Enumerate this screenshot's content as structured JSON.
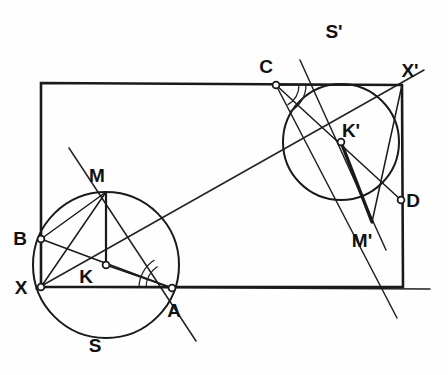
{
  "figure": {
    "type": "euclidean-construction",
    "canvas": {
      "width": 448,
      "height": 375,
      "background": "#fefefe"
    },
    "colors": {
      "stroke": "#1a1a1a",
      "thin_stroke": "#222222",
      "fill": "#ffffff",
      "label": "#111111"
    },
    "stroke_widths": {
      "rectangle": 2.6,
      "circle": 2.0,
      "chord": 1.5,
      "ray": 1.5,
      "bold_segment": 3.2,
      "arc_mark": 1.3
    },
    "rectangle": {
      "name": "bounding-rectangle",
      "corners": [
        {
          "label": "top-left",
          "x": 41,
          "y": 83
        },
        {
          "label": "X'",
          "x": 402,
          "y": 85
        },
        {
          "label": "bottom-right",
          "x": 403,
          "y": 287
        },
        {
          "label": "X",
          "x": 41,
          "y": 287
        }
      ]
    },
    "circles": [
      {
        "name": "circle-S",
        "label": "S",
        "center_label": "K",
        "cx": 106,
        "cy": 265,
        "r": 73
      },
      {
        "name": "circle-S-prime",
        "label": "S'",
        "center_label": "K'",
        "cx": 341,
        "cy": 142,
        "r": 58
      }
    ],
    "points": [
      {
        "id": "X",
        "label": "X",
        "x": 41,
        "y": 287,
        "marker": "open",
        "label_dx": -20,
        "label_dy": 7
      },
      {
        "id": "B",
        "label": "B",
        "x": 41,
        "y": 239,
        "marker": "open",
        "label_dx": -21,
        "label_dy": 6
      },
      {
        "id": "M",
        "label": "M",
        "x": 106,
        "y": 192,
        "marker": "none",
        "label_dx": -9,
        "label_dy": -10
      },
      {
        "id": "K",
        "label": "K",
        "x": 106,
        "y": 265,
        "marker": "open",
        "label_dx": -20,
        "label_dy": 18
      },
      {
        "id": "A",
        "label": "A",
        "x": 172,
        "y": 288,
        "marker": "open",
        "label_dx": 2,
        "label_dy": 29
      },
      {
        "id": "S",
        "label": "S",
        "x": 101,
        "y": 352,
        "marker": "none",
        "label_dx": -6,
        "label_dy": 0
      },
      {
        "id": "C",
        "label": "C",
        "x": 276,
        "y": 85,
        "marker": "open",
        "label_dx": -10,
        "label_dy": -12
      },
      {
        "id": "Xp",
        "label": "X'",
        "x": 402,
        "y": 85,
        "marker": "none",
        "label_dx": 8,
        "label_dy": -8
      },
      {
        "id": "Kp",
        "label": "K'",
        "x": 341,
        "y": 142,
        "marker": "open",
        "label_dx": 10,
        "label_dy": -5
      },
      {
        "id": "D",
        "label": "D",
        "x": 401,
        "y": 200,
        "marker": "open",
        "label_dx": 12,
        "label_dy": 7
      },
      {
        "id": "Mp",
        "label": "M'",
        "x": 372,
        "y": 222,
        "marker": "none",
        "label_dx": -10,
        "label_dy": 25
      },
      {
        "id": "Sp",
        "label": "S'",
        "x": 339,
        "y": 38,
        "marker": "none",
        "label_dx": -5,
        "label_dy": 0
      }
    ],
    "segments": [
      {
        "name": "chord-B-A",
        "x1": 41,
        "y1": 239,
        "x2": 172,
        "y2": 288,
        "w": 1.5
      },
      {
        "name": "chord-X-M",
        "x1": 41,
        "y1": 287,
        "x2": 106,
        "y2": 192,
        "w": 1.5
      },
      {
        "name": "radius-K-M",
        "x1": 106,
        "y1": 265,
        "x2": 106,
        "y2": 192,
        "w": 2.2
      },
      {
        "name": "chord-B-M",
        "x1": 41,
        "y1": 239,
        "x2": 106,
        "y2": 192,
        "w": 1.5
      },
      {
        "name": "radius-K-A",
        "x1": 106,
        "y1": 265,
        "x2": 172,
        "y2": 288,
        "w": 1.5
      },
      {
        "name": "chord-C-D",
        "x1": 276,
        "y1": 85,
        "x2": 401,
        "y2": 200,
        "w": 1.5
      },
      {
        "name": "chord-Xp-Mp",
        "x1": 402,
        "y1": 85,
        "x2": 372,
        "y2": 222,
        "w": 1.5
      },
      {
        "name": "segment-Kp-Mp",
        "x1": 341,
        "y1": 142,
        "x2": 372,
        "y2": 222,
        "w": 3.4
      },
      {
        "name": "chord-C-Xp",
        "x1": 276,
        "y1": 85,
        "x2": 402,
        "y2": 85,
        "w": 1.5
      }
    ],
    "rays": [
      {
        "name": "ray-X-to-Xp-diagonal",
        "x1": 36,
        "y1": 289,
        "x2": 424,
        "y2": 70,
        "w": 1.5
      },
      {
        "name": "ray-through-M-and-A",
        "x1": 69,
        "y1": 148,
        "x2": 196,
        "y2": 341,
        "w": 1.5
      },
      {
        "name": "ray-X-through-A",
        "x1": 41,
        "y1": 287,
        "x2": 430,
        "y2": 289,
        "w": 1.5
      },
      {
        "name": "ray-C-through-Mp",
        "x1": 276,
        "y1": 85,
        "x2": 397,
        "y2": 318,
        "w": 1.5
      },
      {
        "name": "ray-Kp-extended-down",
        "x1": 300,
        "y1": 60,
        "x2": 386,
        "y2": 250,
        "w": 1.5
      }
    ],
    "angle_arcs": [
      {
        "name": "angle-mark-at-A",
        "cx": 172,
        "cy": 288,
        "r": 33,
        "start_deg": 180,
        "end_deg": 238
      },
      {
        "name": "angle-mark-at-A-inner",
        "cx": 172,
        "cy": 288,
        "r": 26,
        "start_deg": 180,
        "end_deg": 236
      },
      {
        "name": "angle-mark-at-C",
        "cx": 276,
        "cy": 85,
        "r": 30,
        "start_deg": 0,
        "end_deg": 62
      },
      {
        "name": "angle-mark-at-C-inner",
        "cx": 276,
        "cy": 85,
        "r": 23,
        "start_deg": 0,
        "end_deg": 60
      }
    ]
  }
}
